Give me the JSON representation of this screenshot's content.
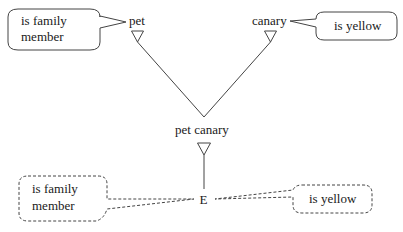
{
  "diagram": {
    "nodes": {
      "pet": "pet",
      "canary": "canary",
      "pet_canary": "pet canary",
      "entity": "E"
    },
    "callouts": {
      "top_left": {
        "line1": "is family",
        "line2": "member",
        "style": "solid"
      },
      "top_right": {
        "line1": "is yellow",
        "style": "solid"
      },
      "bottom_left": {
        "line1": "is family",
        "line2": "member",
        "style": "dashed"
      },
      "bottom_right": {
        "line1": "is yellow",
        "style": "dashed"
      }
    },
    "edges": [
      {
        "from": "pet",
        "to": "pet canary",
        "type": "inheritance"
      },
      {
        "from": "canary",
        "to": "pet canary",
        "type": "inheritance"
      },
      {
        "from": "pet canary",
        "to": "E",
        "type": "instance"
      }
    ],
    "colors": {
      "line": "#444444",
      "text": "#1a1a1a",
      "background": "#ffffff"
    }
  }
}
